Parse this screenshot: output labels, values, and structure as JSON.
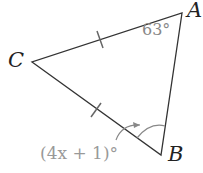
{
  "diagram": {
    "vertices": {
      "A": {
        "label": "A",
        "x": 182,
        "y": 13
      },
      "B": {
        "label": "B",
        "x": 161,
        "y": 155
      },
      "C": {
        "label": "C",
        "x": 32,
        "y": 62
      }
    },
    "angle_A": "63°",
    "angle_B": "(4x + 1)°",
    "congruent_sides": [
      "CA",
      "CB"
    ],
    "colors": {
      "line": "#333333",
      "annotation": "#888888",
      "label": "#222222"
    }
  }
}
